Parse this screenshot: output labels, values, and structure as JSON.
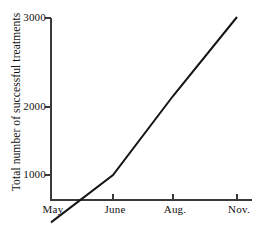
{
  "chart_data": {
    "type": "line",
    "title": "",
    "xlabel": "",
    "ylabel": "Total number of successful treatments",
    "categories": [
      "May",
      "June",
      "Aug.",
      "Nov."
    ],
    "values": [
      400,
      1000,
      2000,
      3000
    ],
    "series": [
      {
        "name": "Total number of successful treatments",
        "values": [
          400,
          1000,
          2000,
          3000
        ]
      }
    ],
    "x_tick_labels": [
      "May",
      "June",
      "Aug.",
      "Nov."
    ],
    "y_tick_labels": [
      "1000",
      "2000",
      "3000"
    ],
    "y_tick_values": [
      1000,
      2000,
      3000
    ],
    "ylim": [
      400,
      3000
    ],
    "xlim": [
      0,
      3
    ],
    "grid": false,
    "legend": false,
    "legend_position": "none",
    "line_color": "#141414",
    "axis_color": "#3a3a3a",
    "background_color": "#ffffff"
  },
  "axes": {
    "y_ticks": [
      {
        "label": "3000",
        "value": 3000
      },
      {
        "label": "2000",
        "value": 2000
      },
      {
        "label": "1000",
        "value": 1000
      }
    ],
    "x_ticks": [
      {
        "label": "May",
        "value": 0
      },
      {
        "label": "June",
        "value": 1
      },
      {
        "label": "Aug.",
        "value": 2
      },
      {
        "label": "Nov.",
        "value": 3
      }
    ],
    "y_axis_title": "Total number of successful treatments"
  }
}
